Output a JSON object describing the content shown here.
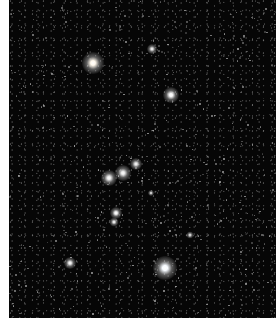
{
  "image": {
    "subject": "Orion constellation star field",
    "background_color": "#060606",
    "page_color": "#ffffff",
    "bright_stars": [
      {
        "name": "betelgeuse",
        "x": 93,
        "y": 63,
        "size": 22,
        "color": "#fff8ec"
      },
      {
        "name": "meissa",
        "x": 152,
        "y": 49,
        "size": 10,
        "color": "#dcdcdc"
      },
      {
        "name": "bellatrix",
        "x": 171,
        "y": 95,
        "size": 16,
        "color": "#f2f2f2"
      },
      {
        "name": "belt-alnitak",
        "x": 109,
        "y": 178,
        "size": 16,
        "color": "#e6e6e6"
      },
      {
        "name": "belt-alnilam",
        "x": 123,
        "y": 173,
        "size": 16,
        "color": "#e6e6e6"
      },
      {
        "name": "belt-mintaka",
        "x": 136,
        "y": 164,
        "size": 12,
        "color": "#e0e0e0"
      },
      {
        "name": "sword-upper",
        "x": 116,
        "y": 213,
        "size": 12,
        "color": "#f4f4f4"
      },
      {
        "name": "sword-lower",
        "x": 114,
        "y": 222,
        "size": 9,
        "color": "#e0e0e0"
      },
      {
        "name": "saiph",
        "x": 70,
        "y": 263,
        "size": 12,
        "color": "#e8e8e8"
      },
      {
        "name": "rigel",
        "x": 165,
        "y": 268,
        "size": 24,
        "color": "#f6faff"
      },
      {
        "name": "eta-ori",
        "x": 190,
        "y": 235,
        "size": 7,
        "color": "#d0d0d0"
      },
      {
        "name": "sigma-ori",
        "x": 151,
        "y": 193,
        "size": 6,
        "color": "#d0d0d0"
      }
    ]
  }
}
